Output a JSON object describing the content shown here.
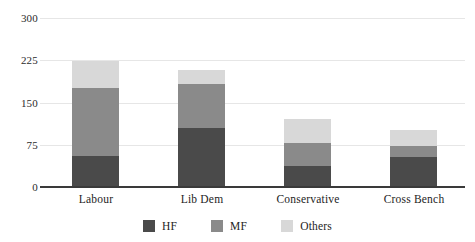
{
  "chart_data": {
    "type": "bar",
    "subtype": "stacked-bar",
    "title": "",
    "xlabel": "",
    "ylabel": "",
    "categories": [
      "Labour",
      "Lib Dem",
      "Conservative",
      "Cross Bench"
    ],
    "series": [
      {
        "name": "HF",
        "color": "#4a4a4a",
        "values": [
          55,
          105,
          38,
          53
        ]
      },
      {
        "name": "MF",
        "color": "#8a8a8a",
        "values": [
          121,
          77,
          40,
          19
        ]
      },
      {
        "name": "Others",
        "color": "#d8d8d8",
        "values": [
          47,
          26,
          42,
          30
        ]
      }
    ],
    "totals": [
      223,
      208,
      120,
      102
    ],
    "ylim": [
      0,
      300
    ],
    "yticks": [
      0,
      75,
      150,
      225,
      300
    ],
    "ytick_labels": [
      "0",
      "75",
      "150",
      "225",
      "300"
    ],
    "grid": true,
    "grid_axis": "y",
    "legend": {
      "position": "bottom",
      "entries": [
        "HF",
        "MF",
        "Others"
      ]
    },
    "background": "#ffffff",
    "axis_color": "#3a3a3a",
    "gridline_color": "#e6e6e6"
  }
}
